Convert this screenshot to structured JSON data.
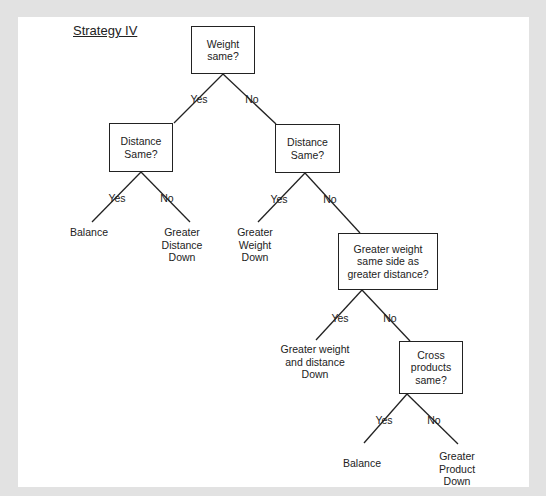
{
  "title": "Strategy IV",
  "colors": {
    "frame": "#e2e2e2",
    "panel": "#ffffff",
    "ink": "#222222"
  },
  "nodes": {
    "weight_same": "Weight\nsame?",
    "distance_same_left": "Distance\nSame?",
    "distance_same_right": "Distance\nSame?",
    "greater_weight_same_side": "Greater weight\nsame side as\ngreater distance?",
    "cross_products_same": "Cross\nproducts\nsame?"
  },
  "leaves": {
    "balance_1": "Balance",
    "greater_distance_down": "Greater\nDistance\nDown",
    "greater_weight_down": "Greater\nWeight\nDown",
    "greater_weight_and_distance_down": "Greater weight\nand distance\nDown",
    "balance_2": "Balance",
    "greater_product_down": "Greater\nProduct\nDown"
  },
  "edge_labels": {
    "yes": "Yes",
    "no": "No"
  }
}
